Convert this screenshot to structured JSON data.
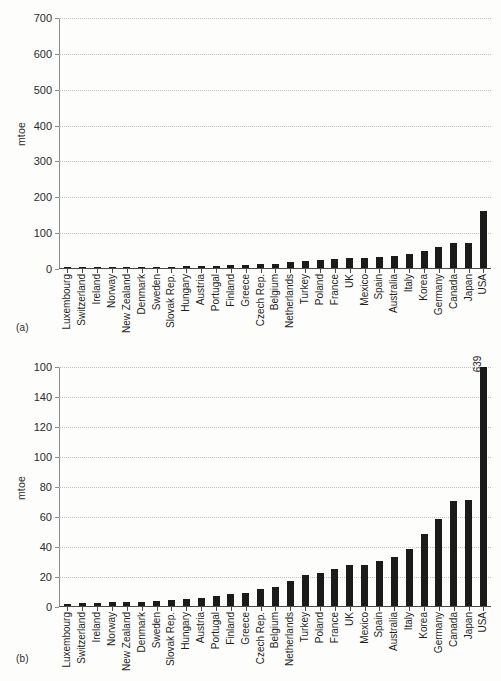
{
  "figure": {
    "panel_a_tag": "(a)",
    "panel_b_tag": "(b)"
  },
  "chart_data": [
    {
      "id": "panel-a",
      "type": "bar",
      "title": "",
      "xlabel": "",
      "ylabel": "mtoe",
      "ylim": [
        0,
        700
      ],
      "yticks": [
        0,
        100,
        200,
        300,
        400,
        500,
        600,
        700
      ],
      "ytick_labels": [
        "0",
        "100",
        "200",
        "300",
        "400",
        "500",
        "600",
        "700"
      ],
      "grid": true,
      "legend": "none",
      "categories": [
        "Luxembourg",
        "Switzerland",
        "Ireland",
        "Norway",
        "New Zealand",
        "Denmark",
        "Sweden",
        "Slovak Rep.",
        "Hungary",
        "Austria",
        "Portugal",
        "Finland",
        "Greece",
        "Czech Rep.",
        "Belgium",
        "Netherlands",
        "Turkey",
        "Poland",
        "France",
        "UK",
        "Mexico",
        "Spain",
        "Australia",
        "Italy",
        "Korea",
        "Germany",
        "Canada",
        "Japan",
        "USA"
      ],
      "values": [
        1.5,
        2.0,
        2.1,
        2.4,
        2.5,
        3.0,
        3.3,
        4.0,
        5.0,
        5.3,
        7.0,
        8.0,
        9.0,
        11.5,
        12.5,
        16.5,
        21.0,
        22.0,
        24.5,
        27.5,
        27.5,
        30.0,
        32.5,
        38.0,
        48.0,
        58.0,
        70.0,
        71.0,
        160.0,
        639.0
      ],
      "annotations": []
    },
    {
      "id": "panel-b",
      "type": "bar",
      "title": "",
      "xlabel": "",
      "ylabel": "mtoe",
      "ylim": [
        0,
        160
      ],
      "yticks": [
        0,
        20,
        40,
        60,
        80,
        100,
        120,
        140,
        160
      ],
      "ytick_labels": [
        "0",
        "20",
        "40",
        "60",
        "80",
        "100",
        "120",
        "140",
        "100"
      ],
      "grid": true,
      "legend": "none",
      "categories": [
        "Luxembourg",
        "Switzerland",
        "Ireland",
        "Norway",
        "New Zealand",
        "Denmark",
        "Sweden",
        "Slovak Rep.",
        "Hungary",
        "Austria",
        "Portugal",
        "Finland",
        "Greece",
        "Czech Rep.",
        "Belgium",
        "Netherlands",
        "Turkey",
        "Poland",
        "France",
        "UK",
        "Mexico",
        "Spain",
        "Australia",
        "Italy",
        "Korea",
        "Germany",
        "Canada",
        "Japan",
        "USA"
      ],
      "values": [
        1.5,
        2.0,
        2.1,
        2.4,
        2.5,
        3.0,
        3.3,
        4.0,
        5.0,
        5.3,
        7.0,
        8.0,
        9.0,
        11.5,
        12.5,
        16.5,
        21.0,
        22.0,
        24.5,
        27.5,
        27.5,
        30.0,
        32.5,
        38.0,
        48.0,
        58.0,
        70.0,
        71.0,
        160.0,
        639.0
      ],
      "clipped_bars": [
        "Japan",
        "USA"
      ],
      "annotations": [
        {
          "category": "USA",
          "text": "639"
        }
      ]
    }
  ]
}
